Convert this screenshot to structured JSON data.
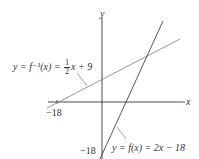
{
  "diagram": {
    "axes": {
      "x_label": "x",
      "y_label": "y"
    },
    "ticks": {
      "x_tick": "−18",
      "y_tick": "−18"
    },
    "inverse_label": {
      "prefix": "y = f⁻¹(x) = ",
      "frac_num": "1",
      "frac_den": "2",
      "suffix": "x + 9"
    },
    "function_label": "y = f(x) = 2x − 18",
    "colors": {
      "axis": "#333333",
      "f_line": "#444444",
      "inverse_line": "#888888",
      "leader": "#777777"
    }
  }
}
